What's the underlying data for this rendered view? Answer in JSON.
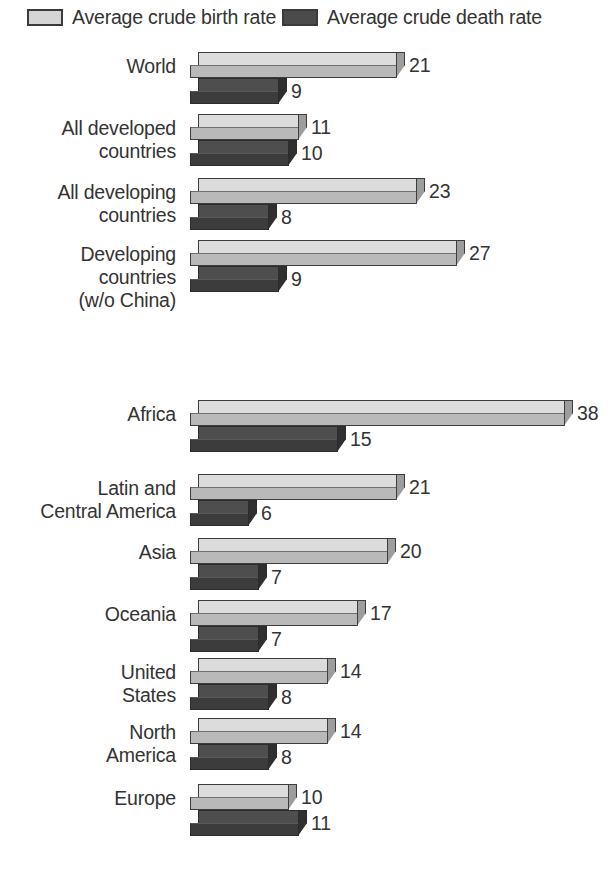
{
  "legend": {
    "birth": {
      "label": "Average crude birth rate",
      "swatch": "light-gray-swatch",
      "color": "#d5d5d5"
    },
    "death": {
      "label": "Average crude death rate",
      "swatch": "dark-gray-swatch",
      "color": "#4b4b4b"
    }
  },
  "chart_data": {
    "type": "bar",
    "orientation": "horizontal",
    "title": "",
    "xlabel": "",
    "ylabel": "",
    "grid": false,
    "legend_position": "top",
    "xlim": [
      0,
      38
    ],
    "categories": [
      "World",
      "All developed countries",
      "All developing countries",
      "Developing countries (w/o China)",
      "Africa",
      "Latin and Central America",
      "Asia",
      "Oceania",
      "United States",
      "North America",
      "Europe"
    ],
    "series": [
      {
        "name": "Average crude birth rate",
        "values": [
          21,
          11,
          23,
          27,
          38,
          21,
          20,
          17,
          14,
          14,
          10
        ]
      },
      {
        "name": "Average crude death rate",
        "values": [
          9,
          10,
          8,
          9,
          15,
          6,
          7,
          7,
          8,
          8,
          11
        ]
      }
    ]
  },
  "groups": [
    {
      "name": "World",
      "lines": [
        "World"
      ],
      "birth": "21",
      "death": "9",
      "birth_v": 21,
      "death_v": 9
    },
    {
      "name": "All developed",
      "lines": [
        "All developed",
        "countries"
      ],
      "birth": "11",
      "death": "10",
      "birth_v": 11,
      "death_v": 10
    },
    {
      "name": "All developing",
      "lines": [
        "All developing",
        "countries"
      ],
      "birth": "23",
      "death": "8",
      "birth_v": 23,
      "death_v": 8
    },
    {
      "name": "Developing w/o China",
      "lines": [
        "Developing",
        "countries",
        "(w/o China)"
      ],
      "birth": "27",
      "death": "9",
      "birth_v": 27,
      "death_v": 9
    },
    {
      "name": "Africa",
      "lines": [
        "Africa"
      ],
      "birth": "38",
      "death": "15",
      "birth_v": 38,
      "death_v": 15
    },
    {
      "name": "Latin and Central America",
      "lines": [
        "Latin and",
        "Central America"
      ],
      "birth": "21",
      "death": "6",
      "birth_v": 21,
      "death_v": 6
    },
    {
      "name": "Asia",
      "lines": [
        "Asia"
      ],
      "birth": "20",
      "death": "7",
      "birth_v": 20,
      "death_v": 7
    },
    {
      "name": "Oceania",
      "lines": [
        "Oceania"
      ],
      "birth": "17",
      "death": "7",
      "birth_v": 17,
      "death_v": 7
    },
    {
      "name": "United States",
      "lines": [
        "United",
        "States"
      ],
      "birth": "14",
      "death": "8",
      "birth_v": 14,
      "death_v": 8
    },
    {
      "name": "North America",
      "lines": [
        "North",
        "America"
      ],
      "birth": "14",
      "death": "8",
      "birth_v": 14,
      "death_v": 8
    },
    {
      "name": "Europe",
      "lines": [
        "Europe"
      ],
      "birth": "10",
      "death": "11",
      "birth_v": 10,
      "death_v": 11
    }
  ]
}
